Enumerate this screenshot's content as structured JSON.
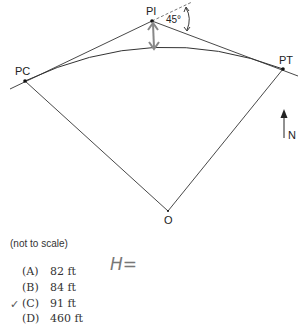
{
  "diagram": {
    "points": {
      "PC": {
        "label": "PC",
        "x": 25,
        "y": 81
      },
      "PI": {
        "label": "PI",
        "x": 152,
        "y": 21
      },
      "PT": {
        "label": "PT",
        "x": 283,
        "y": 69
      },
      "O": {
        "label": "O",
        "x": 168,
        "y": 210
      }
    },
    "angle_label": "45°",
    "north_label": "N"
  },
  "note": "(not to scale)",
  "choices": [
    {
      "letter": "(A)",
      "value": "82 ft",
      "checked": false
    },
    {
      "letter": "(B)",
      "value": "84 ft",
      "checked": false
    },
    {
      "letter": "(C)",
      "value": "91 ft",
      "checked": true
    },
    {
      "letter": "(D)",
      "value": "460 ft",
      "checked": false
    }
  ],
  "check_mark": "✓",
  "handwritten_note": "H="
}
